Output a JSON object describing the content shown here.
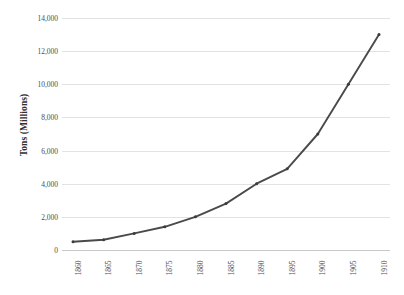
{
  "chart_data": {
    "type": "line",
    "title": "",
    "xlabel": "",
    "ylabel": "Tons (Millions)",
    "categories": [
      "1860",
      "1865",
      "1870",
      "1875",
      "1880",
      "1885",
      "1890",
      "1895",
      "1900",
      "1905",
      "1910"
    ],
    "x": [
      1860,
      1865,
      1870,
      1875,
      1880,
      1885,
      1890,
      1895,
      1900,
      1905,
      1910
    ],
    "values": [
      500,
      620,
      1000,
      1400,
      2000,
      2800,
      4000,
      4900,
      7000,
      10000,
      13000
    ],
    "series": [
      {
        "name": "Tons (Millions)",
        "values": [
          500,
          620,
          1000,
          1400,
          2000,
          2800,
          4000,
          4900,
          7000,
          10000,
          13000
        ],
        "color": "#4a4a4a"
      }
    ],
    "ylim": [
      0,
      14000
    ],
    "yticks": [
      0,
      2000,
      4000,
      6000,
      8000,
      10000,
      12000,
      14000
    ],
    "ytick_labels": [
      "0",
      "2,000",
      "4,000",
      "6,000",
      "8,000",
      "10,000",
      "12,000",
      "14,000"
    ],
    "xtick_labels": [
      "1860",
      "1865",
      "1870",
      "1875",
      "1880",
      "1885",
      "1890",
      "1895",
      "1900",
      "1905",
      "1910"
    ],
    "grid": true,
    "grid_axis": "y",
    "legend": false,
    "legend_position": "none",
    "markers": true,
    "annotations": []
  },
  "style": {
    "background": "#ffffff",
    "gridline_color": "#e2e2e2",
    "axis_color": "#c8c8c8",
    "line_color": "#4a4a4a",
    "marker_color": "#3c3c3c",
    "text_color": "#4b4b4b",
    "title_color": "#2f2f2f"
  }
}
